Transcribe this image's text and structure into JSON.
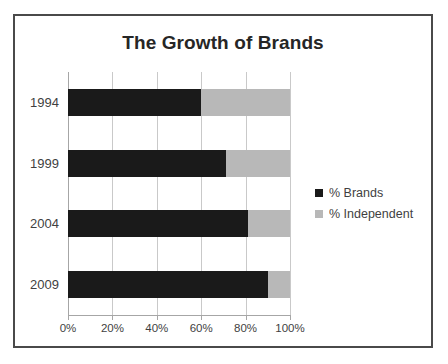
{
  "chart_data": {
    "type": "bar",
    "orientation": "horizontal",
    "stacked": true,
    "title": "The Growth of Brands",
    "xlabel": "",
    "ylabel": "",
    "categories": [
      "1994",
      "1999",
      "2004",
      "2009"
    ],
    "series": [
      {
        "name": "% Brands",
        "color": "#1a1a1a",
        "values": [
          60,
          71,
          81,
          90
        ]
      },
      {
        "name": "% Independent",
        "color": "#b8b8b8",
        "values": [
          40,
          29,
          19,
          10
        ]
      }
    ],
    "xlim": [
      0,
      100
    ],
    "xticks": [
      0,
      20,
      40,
      60,
      80,
      100
    ],
    "xtick_labels": [
      "0%",
      "20%",
      "40%",
      "60%",
      "80%",
      "100%"
    ],
    "grid": true,
    "legend_position": "right",
    "legend": [
      "% Brands",
      "% Independent"
    ]
  },
  "frame": {
    "border_color": "#4a4a4a"
  }
}
